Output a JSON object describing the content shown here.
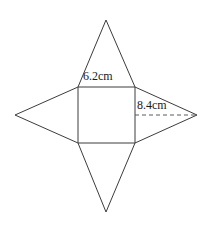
{
  "figure": {
    "kind": "square-pyramid-net",
    "background_color": "#ffffff",
    "line_color": "#3c3c3c",
    "dashed_line_color": "#5a5a5a",
    "label_color": "#1a1a1a",
    "labels": {
      "base_edge": "6.2cm",
      "slant_height": "8.4cm"
    },
    "geometry": {
      "square": {
        "left": 78,
        "top": 87,
        "right": 135,
        "bottom": 143
      },
      "apexes": {
        "top": {
          "x": 106,
          "y": 20
        },
        "bottom": {
          "x": 106,
          "y": 212
        },
        "left": {
          "x": 15,
          "y": 115
        },
        "right": {
          "x": 197,
          "y": 115
        }
      },
      "dashed_segment": {
        "x1": 135,
        "y1": 115,
        "x2": 197,
        "y2": 115
      }
    }
  }
}
